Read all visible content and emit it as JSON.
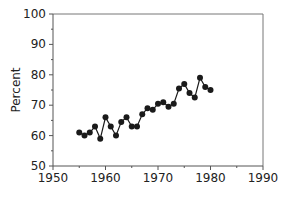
{
  "chart_data": {
    "type": "line",
    "title": "",
    "xlabel": "",
    "ylabel": "Percent",
    "xlim": [
      1950,
      1990
    ],
    "ylim": [
      50,
      100
    ],
    "xticks": [
      1950,
      1960,
      1970,
      1980,
      1990
    ],
    "yticks": [
      50,
      60,
      70,
      80,
      90,
      100
    ],
    "grid": false,
    "legend": null,
    "series": [
      {
        "name": "Percent",
        "marker": "circle",
        "color": "#1a1a1a",
        "x": [
          1955,
          1956,
          1957,
          1958,
          1959,
          1960,
          1961,
          1962,
          1963,
          1964,
          1965,
          1966,
          1967,
          1968,
          1969,
          1970,
          1971,
          1972,
          1973,
          1974,
          1975,
          1976,
          1977,
          1978,
          1979,
          1980
        ],
        "values": [
          61,
          60,
          61,
          63,
          59,
          66,
          63,
          60,
          64.5,
          66,
          63,
          63,
          67,
          69,
          68.5,
          70.5,
          71,
          69.5,
          70.5,
          75.5,
          77,
          74,
          72.5,
          79,
          76,
          75
        ]
      }
    ]
  }
}
